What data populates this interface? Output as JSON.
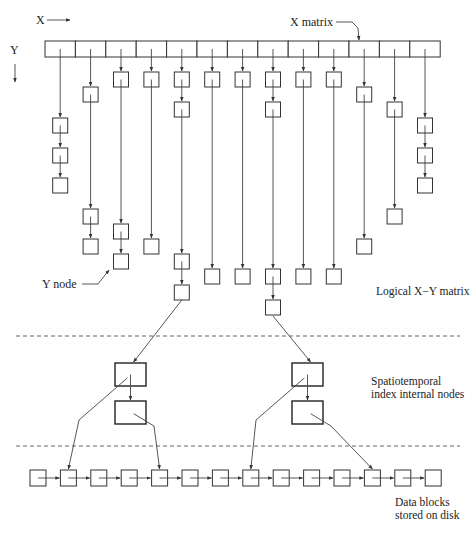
{
  "labels": {
    "x_axis": "X",
    "y_axis": "Y",
    "x_matrix": "X matrix",
    "y_node": "Y node",
    "logical_matrix": "Logical X−Y matrix",
    "internal_nodes_line1": "Spatiotemporal",
    "internal_nodes_line2": "index internal nodes",
    "data_blocks_line1": "Data blocks",
    "data_blocks_line2": "stored on disk"
  },
  "x_matrix": {
    "cell_count": 13,
    "columns": [
      {
        "id": 0,
        "nodes": 3
      },
      {
        "id": 1,
        "nodes": 3
      },
      {
        "id": 2,
        "nodes": 4
      },
      {
        "id": 3,
        "nodes": 2
      },
      {
        "id": 4,
        "nodes": 5
      },
      {
        "id": 5,
        "nodes": 2
      },
      {
        "id": 6,
        "nodes": 2
      },
      {
        "id": 7,
        "nodes": 4
      },
      {
        "id": 8,
        "nodes": 2
      },
      {
        "id": 9,
        "nodes": 2
      },
      {
        "id": 10,
        "nodes": 2
      },
      {
        "id": 11,
        "nodes": 2
      },
      {
        "id": 12,
        "nodes": 3
      }
    ]
  },
  "index_trees": [
    {
      "name": "left-index-tree",
      "internal_nodes": 2,
      "points_to_blocks": [
        1,
        4
      ]
    },
    {
      "name": "right-index-tree",
      "internal_nodes": 2,
      "points_to_blocks": [
        7,
        11
      ]
    }
  ],
  "data_blocks": {
    "count": 14
  }
}
